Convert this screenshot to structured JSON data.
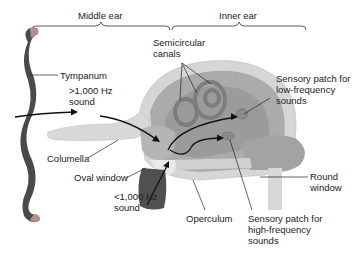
{
  "diagram": {
    "sections": {
      "middle_ear": "Middle ear",
      "inner_ear": "Inner ear"
    },
    "labels": {
      "tympanum": "Tympanum",
      "high_freq_sound": ">1,000 Hz\nsound",
      "semicircular_canals": "Semicircular\ncanals",
      "sensory_low": "Sensory patch for\nlow-frequency\nsounds",
      "columella": "Columella",
      "oval_window": "Oval window",
      "low_freq_sound": "<1,000 Hz\nsound",
      "round_window": "Round\nwindow",
      "operculum": "Operculum",
      "sensory_high": "Sensory patch for\nhigh-frequency\nsounds"
    },
    "colors": {
      "tympanum_dark": "#4a4a4a",
      "tympanum_tip": "#b88f8a",
      "bone_light": "#d9d9d9",
      "tissue_mid": "#a9a9a9",
      "tissue_dark": "#8c8c8c",
      "operculum_muscle": "#555555",
      "text": "#222222"
    }
  }
}
